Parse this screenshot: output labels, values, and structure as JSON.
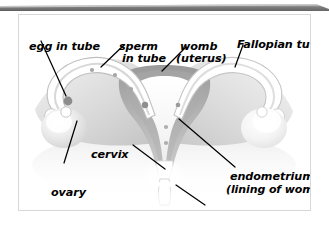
{
  "figure": {
    "style": "grayscale anatomical illustration",
    "background_color": "#ffffff",
    "frame_border_color": "#d8d8d8",
    "top_bar_color": "#6e6e6e",
    "label_color": "#000000",
    "leader_line_color": "#000000"
  },
  "labels": [
    {
      "id": "egg-in-tube",
      "text": "egg in tube",
      "x": 10,
      "y": 26
    },
    {
      "id": "sperm-line1",
      "text": "sperm",
      "x": 100,
      "y": 26
    },
    {
      "id": "sperm-line2",
      "text": "in tube",
      "x": 103,
      "y": 38
    },
    {
      "id": "womb-line1",
      "text": "womb",
      "x": 161,
      "y": 26
    },
    {
      "id": "womb-line2",
      "text": "(uterus)",
      "x": 157,
      "y": 38
    },
    {
      "id": "fallopian",
      "text": "Fallopian tube",
      "x": 218,
      "y": 24
    },
    {
      "id": "cervix",
      "text": "cervix",
      "x": 72,
      "y": 134
    },
    {
      "id": "ovary",
      "text": "ovary",
      "x": 32,
      "y": 172
    },
    {
      "id": "endometrium1",
      "text": "endometrium",
      "x": 211,
      "y": 156
    },
    {
      "id": "endometrium2",
      "text": "(lining of womb)",
      "x": 207,
      "y": 169
    },
    {
      "id": "vagina",
      "text": "vagina",
      "x": 184,
      "y": 195
    }
  ],
  "structures": [
    "left fallopian tube",
    "right fallopian tube",
    "left ovary",
    "right ovary",
    "uterus (womb) body",
    "endometrium lining",
    "uterine cavity",
    "cervix",
    "vagina",
    "egg travelling in tube",
    "sperm travelling in tube"
  ],
  "markers": {
    "egg_dot_color": "#8c8c8c",
    "sperm_dot_color": "#a6a6a6",
    "egg_count": 1,
    "sperm_count": 6
  }
}
